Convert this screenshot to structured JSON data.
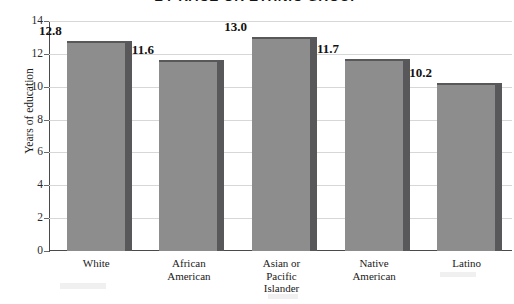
{
  "chart_data": {
    "type": "bar",
    "title": "BY RACE OR ETHNIC GROUP",
    "xlabel": "",
    "ylabel": "Years of education",
    "ylim": [
      0,
      14
    ],
    "yticks": [
      0,
      2,
      4,
      6,
      8,
      10,
      12,
      14
    ],
    "grid": true,
    "legend": "none",
    "categories": [
      "White",
      "African American",
      "Asian or Pacific Islander",
      "Native American",
      "Latino"
    ],
    "category_lines": [
      [
        "White"
      ],
      [
        "African",
        "American"
      ],
      [
        "Asian or",
        "Pacific",
        "Islander"
      ],
      [
        "Native",
        "American"
      ],
      [
        "Latino"
      ]
    ],
    "values": [
      12.8,
      11.6,
      13.0,
      11.7,
      10.2
    ],
    "value_labels": [
      "12.8",
      "11.6",
      "13.0",
      "11.7",
      "10.2"
    ],
    "bar_color": "#8d8d8d",
    "bar_side_color": "#58585a",
    "gridline_color": "#d7d7d7",
    "axis_color": "#4a4a4a"
  },
  "axis": {
    "y_title": "Years of education",
    "tick_labels": [
      "14",
      "12",
      "10",
      "8",
      "6",
      "4",
      "2",
      "0"
    ]
  }
}
